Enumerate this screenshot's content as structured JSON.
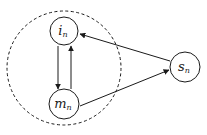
{
  "diagram": {
    "type": "state-transition",
    "boundary": {
      "shape": "dashed-circle",
      "encloses": [
        "i_n",
        "m_n"
      ]
    },
    "nodes": [
      {
        "id": "i_n",
        "base": "i",
        "sub": "n",
        "cx": 64,
        "cy": 31,
        "r": 14
      },
      {
        "id": "m_n",
        "base": "m",
        "sub": "n",
        "cx": 64,
        "cy": 104,
        "r": 15
      },
      {
        "id": "s_n",
        "base": "s",
        "sub": "n",
        "cx": 185,
        "cy": 67,
        "r": 15
      }
    ],
    "edges": [
      {
        "from": "i_n",
        "to": "m_n"
      },
      {
        "from": "m_n",
        "to": "i_n"
      },
      {
        "from": "s_n",
        "to": "i_n"
      },
      {
        "from": "m_n",
        "to": "s_n"
      }
    ],
    "colors": {
      "stroke": "#1a1a1a",
      "background": "#ffffff"
    }
  }
}
